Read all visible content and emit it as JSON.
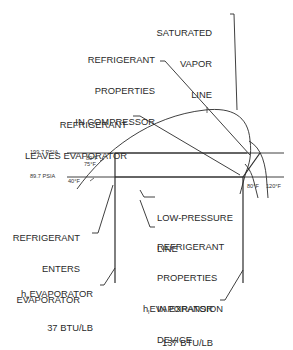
{
  "diagram": {
    "type": "pressure-enthalpy refrigeration cycle",
    "colors": {
      "line": "#2a2a2a",
      "text": "#2a2a2a",
      "background": "#ffffff"
    },
    "labels": {
      "saturated_vapor_line": [
        "SATURATED",
        "VAPOR",
        "LINE"
      ],
      "compressor": [
        "REFRIGERANT",
        "PROPERTIES",
        "IN COMPRESSOR"
      ],
      "leaves_evaporator": [
        "REFRIGERANT",
        "LEAVES EVAPORATOR"
      ],
      "low_pressure_line": [
        "LOW-PRESSURE",
        "LINE"
      ],
      "enters_evaporator": [
        "REFRIGERANT",
        "ENTERS",
        "EVAPORATOR"
      ],
      "expansion_device": [
        "REFRIGERANT",
        "PROPERTIES",
        "IN EXPANSION",
        "DEVICE"
      ],
      "h_e": {
        "prefix": "h",
        "subscript": "e",
        "name": "EVAPORATOR",
        "value": "37 BTU/LB"
      },
      "h_l": {
        "prefix": "h",
        "subscript": "l",
        "name": "EVAPORATOR",
        "value": "137 BTU/LB"
      }
    },
    "pressures": {
      "high": "199.7 PSIA",
      "low": "89.7 PSIA"
    },
    "temperatures": {
      "t80_left": "80°F",
      "t75": "75°F",
      "t40": "40°F",
      "t80_right": "80°F",
      "t120": "120°F"
    }
  }
}
